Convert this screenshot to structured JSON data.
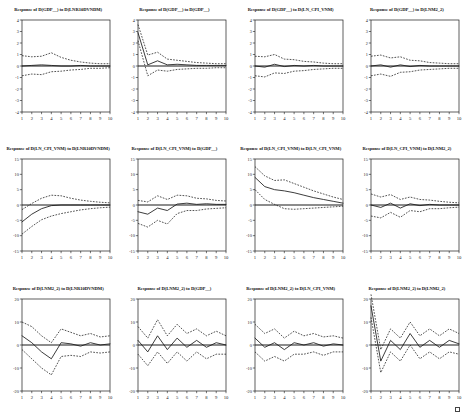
{
  "figure": {
    "name": "impulse-response-matrix",
    "rows": 3,
    "cols": 4,
    "x_ticks": [
      "1",
      "2",
      "3",
      "4",
      "5",
      "6",
      "7",
      "8",
      "9",
      "10"
    ]
  },
  "chart_data": [
    {
      "type": "line",
      "title": "Response of D(GDP__) to D(LNR10DVNDM)",
      "xlabel": "",
      "ylabel": "",
      "x": [
        1,
        2,
        3,
        4,
        5,
        6,
        7,
        8,
        9,
        10
      ],
      "xlim": [
        1,
        10
      ],
      "ylim": [
        -4,
        4
      ],
      "yticks": [
        "4",
        "3",
        "2",
        "1",
        "0",
        "-1",
        "-2",
        "-3",
        "-4"
      ],
      "grid": false,
      "legend": "none",
      "series": [
        {
          "name": "response",
          "style": "solid",
          "values": [
            0.0,
            0.05,
            0.1,
            0.05,
            0.0,
            0.0,
            0.05,
            0.0,
            0.0,
            0.0
          ]
        },
        {
          "name": "upper_2se",
          "style": "dashed",
          "values": [
            0.9,
            0.8,
            0.85,
            1.15,
            0.75,
            0.5,
            0.35,
            0.25,
            0.2,
            0.2
          ]
        },
        {
          "name": "lower_2se",
          "style": "dashed",
          "values": [
            -0.85,
            -0.7,
            -0.75,
            -0.5,
            -0.45,
            -0.35,
            -0.3,
            -0.2,
            -0.2,
            -0.15
          ]
        }
      ]
    },
    {
      "type": "line",
      "title": "Response of D(GDP__) to D(GDP__)",
      "xlabel": "",
      "ylabel": "",
      "x": [
        1,
        2,
        3,
        4,
        5,
        6,
        7,
        8,
        9,
        10
      ],
      "xlim": [
        1,
        10
      ],
      "ylim": [
        -4,
        4
      ],
      "yticks": [
        "4",
        "3",
        "2",
        "1",
        "0",
        "-1",
        "-2",
        "-3",
        "-4"
      ],
      "grid": false,
      "legend": "none",
      "series": [
        {
          "name": "response",
          "style": "solid",
          "values": [
            2.9,
            0.1,
            0.45,
            0.1,
            0.15,
            0.1,
            0.05,
            0.05,
            0.05,
            0.05
          ]
        },
        {
          "name": "upper_2se",
          "style": "dashed",
          "values": [
            3.6,
            0.95,
            1.2,
            0.6,
            0.5,
            0.4,
            0.3,
            0.25,
            0.2,
            0.2
          ]
        },
        {
          "name": "lower_2se",
          "style": "dashed",
          "values": [
            2.2,
            -0.85,
            -0.35,
            -0.45,
            -0.3,
            -0.25,
            -0.2,
            -0.2,
            -0.15,
            -0.15
          ]
        }
      ]
    },
    {
      "type": "line",
      "title": "Response of D(GDP__) to D(LN_CPI_VNM)",
      "xlabel": "",
      "ylabel": "",
      "x": [
        1,
        2,
        3,
        4,
        5,
        6,
        7,
        8,
        9,
        10
      ],
      "xlim": [
        1,
        10
      ],
      "ylim": [
        -4,
        4
      ],
      "yticks": [
        "4",
        "3",
        "2",
        "1",
        "0",
        "-1",
        "-2",
        "-3",
        "-4"
      ],
      "grid": false,
      "legend": "none",
      "series": [
        {
          "name": "response",
          "style": "solid",
          "values": [
            0.0,
            -0.1,
            0.15,
            -0.05,
            0.05,
            0.0,
            0.05,
            0.0,
            0.0,
            0.0
          ]
        },
        {
          "name": "upper_2se",
          "style": "dashed",
          "values": [
            0.85,
            0.8,
            1.0,
            0.6,
            0.55,
            0.4,
            0.35,
            0.25,
            0.2,
            0.2
          ]
        },
        {
          "name": "lower_2se",
          "style": "dashed",
          "values": [
            -0.85,
            -0.95,
            -0.6,
            -0.65,
            -0.45,
            -0.4,
            -0.3,
            -0.25,
            -0.2,
            -0.2
          ]
        }
      ]
    },
    {
      "type": "line",
      "title": "Response of D(GDP__) to D(LNM2_2)",
      "xlabel": "",
      "ylabel": "",
      "x": [
        1,
        2,
        3,
        4,
        5,
        6,
        7,
        8,
        9,
        10
      ],
      "xlim": [
        1,
        10
      ],
      "ylim": [
        -4,
        4
      ],
      "yticks": [
        "4",
        "3",
        "2",
        "1",
        "0",
        "-1",
        "-2",
        "-3",
        "-4"
      ],
      "grid": false,
      "legend": "none",
      "series": [
        {
          "name": "response",
          "style": "solid",
          "values": [
            0.0,
            0.1,
            -0.1,
            0.1,
            -0.05,
            0.05,
            0.0,
            0.0,
            0.0,
            0.0
          ]
        },
        {
          "name": "upper_2se",
          "style": "dashed",
          "values": [
            0.85,
            0.95,
            0.7,
            0.8,
            0.5,
            0.45,
            0.3,
            0.25,
            0.2,
            0.2
          ]
        },
        {
          "name": "lower_2se",
          "style": "dashed",
          "values": [
            -0.85,
            -0.7,
            -0.9,
            -0.55,
            -0.5,
            -0.35,
            -0.3,
            -0.25,
            -0.2,
            -0.2
          ]
        }
      ]
    },
    {
      "type": "line",
      "title": "Response of D(LN_CPI_VNM) to D(LNR10DVNDM)",
      "xlabel": "",
      "ylabel": "",
      "x": [
        1,
        2,
        3,
        4,
        5,
        6,
        7,
        8,
        9,
        10
      ],
      "xlim": [
        1,
        10
      ],
      "ylim": [
        -15,
        15
      ],
      "yticks": [
        "15",
        "10",
        "5",
        "0",
        "-5",
        "-10",
        "-15"
      ],
      "grid": false,
      "legend": "none",
      "series": [
        {
          "name": "response",
          "style": "solid",
          "values": [
            -5.5,
            -3.0,
            -1.2,
            -0.2,
            0.0,
            0.0,
            0.0,
            0.0,
            0.0,
            0.0
          ]
        },
        {
          "name": "upper_2se",
          "style": "dashed",
          "values": [
            -1.5,
            0.5,
            2.2,
            3.2,
            3.0,
            2.2,
            1.6,
            1.2,
            0.9,
            0.7
          ]
        },
        {
          "name": "lower_2se",
          "style": "dashed",
          "values": [
            -9.5,
            -7.0,
            -4.8,
            -3.6,
            -2.8,
            -2.2,
            -1.6,
            -1.2,
            -0.9,
            -0.7
          ]
        }
      ]
    },
    {
      "type": "line",
      "title": "Response of D(LN_CPI_VNM) to D(GDP__)",
      "xlabel": "",
      "ylabel": "",
      "x": [
        1,
        2,
        3,
        4,
        5,
        6,
        7,
        8,
        9,
        10
      ],
      "xlim": [
        1,
        10
      ],
      "ylim": [
        -15,
        15
      ],
      "yticks": [
        "15",
        "10",
        "5",
        "0",
        "-5",
        "-10",
        "-15"
      ],
      "grid": false,
      "legend": "none",
      "series": [
        {
          "name": "response",
          "style": "solid",
          "values": [
            -2.2,
            -3.0,
            -1.0,
            -1.8,
            0.3,
            0.6,
            0.2,
            0.4,
            0.2,
            0.2
          ]
        },
        {
          "name": "upper_2se",
          "style": "dashed",
          "values": [
            1.5,
            1.0,
            3.0,
            1.8,
            3.2,
            3.0,
            2.2,
            2.0,
            1.5,
            1.3
          ]
        },
        {
          "name": "lower_2se",
          "style": "dashed",
          "values": [
            -6.0,
            -7.2,
            -5.0,
            -6.2,
            -2.8,
            -1.8,
            -1.8,
            -1.3,
            -1.1,
            -0.9
          ]
        }
      ]
    },
    {
      "type": "line",
      "title": "Response of D(LN_CPI_VNM) to D(LN_CPI_VNM)",
      "xlabel": "",
      "ylabel": "",
      "x": [
        1,
        2,
        3,
        4,
        5,
        6,
        7,
        8,
        9,
        10
      ],
      "xlim": [
        1,
        10
      ],
      "ylim": [
        -15,
        15
      ],
      "yticks": [
        "15",
        "10",
        "5",
        "0",
        "-5",
        "-10",
        "-15"
      ],
      "grid": false,
      "legend": "none",
      "series": [
        {
          "name": "response",
          "style": "solid",
          "values": [
            9.0,
            6.0,
            5.0,
            4.6,
            4.0,
            3.2,
            2.4,
            1.8,
            1.2,
            0.6
          ]
        },
        {
          "name": "upper_2se",
          "style": "dashed",
          "values": [
            12.5,
            9.5,
            8.0,
            8.2,
            7.0,
            5.8,
            4.6,
            3.6,
            2.6,
            1.8
          ]
        },
        {
          "name": "lower_2se",
          "style": "dashed",
          "values": [
            5.0,
            1.8,
            0.2,
            -1.2,
            -1.4,
            -1.2,
            -1.0,
            -0.8,
            -0.6,
            -0.4
          ]
        }
      ]
    },
    {
      "type": "line",
      "title": "Response of D(LN_CPI_VNM) to D(LNM2_2)",
      "xlabel": "",
      "ylabel": "",
      "x": [
        1,
        2,
        3,
        4,
        5,
        6,
        7,
        8,
        9,
        10
      ],
      "xlim": [
        1,
        10
      ],
      "ylim": [
        -15,
        15
      ],
      "yticks": [
        "15",
        "10",
        "5",
        "0",
        "-5",
        "-10",
        "-15"
      ],
      "grid": false,
      "legend": "none",
      "series": [
        {
          "name": "response",
          "style": "solid",
          "values": [
            0.0,
            -0.8,
            0.6,
            -1.0,
            0.4,
            -0.2,
            0.2,
            0.0,
            0.0,
            0.0
          ]
        },
        {
          "name": "upper_2se",
          "style": "dashed",
          "values": [
            3.6,
            2.6,
            3.4,
            1.8,
            2.6,
            1.8,
            1.6,
            1.2,
            0.9,
            0.7
          ]
        },
        {
          "name": "lower_2se",
          "style": "dashed",
          "values": [
            -3.6,
            -4.2,
            -2.4,
            -4.0,
            -1.8,
            -2.2,
            -1.2,
            -1.2,
            -0.9,
            -0.7
          ]
        }
      ]
    },
    {
      "type": "line",
      "title": "Response of D(LNM2_2) to D(LNR10DVNDM)",
      "xlabel": "",
      "ylabel": "",
      "x": [
        1,
        2,
        3,
        4,
        5,
        6,
        7,
        8,
        9,
        10
      ],
      "xlim": [
        1,
        10
      ],
      "ylim": [
        -20,
        20
      ],
      "yticks": [
        "20",
        "10",
        "0",
        "-10",
        "-20"
      ],
      "grid": false,
      "legend": "none",
      "series": [
        {
          "name": "response",
          "style": "solid",
          "values": [
            4.0,
            1.0,
            -3.0,
            -6.0,
            1.0,
            0.5,
            -0.5,
            1.0,
            0.0,
            0.5
          ]
        },
        {
          "name": "upper_2se",
          "style": "dashed",
          "values": [
            10.0,
            8.0,
            4.0,
            1.0,
            7.0,
            5.5,
            4.0,
            5.0,
            3.5,
            4.0
          ]
        },
        {
          "name": "lower_2se",
          "style": "dashed",
          "values": [
            -2.0,
            -6.0,
            -10.0,
            -13.0,
            -5.0,
            -4.5,
            -5.0,
            -3.0,
            -3.5,
            -3.0
          ]
        }
      ]
    },
    {
      "type": "line",
      "title": "Response of D(LNM2_2) to D(GDP__)",
      "xlabel": "",
      "ylabel": "",
      "x": [
        1,
        2,
        3,
        4,
        5,
        6,
        7,
        8,
        9,
        10
      ],
      "xlim": [
        1,
        10
      ],
      "ylim": [
        -20,
        20
      ],
      "yticks": [
        "20",
        "10",
        "0",
        "-10",
        "-20"
      ],
      "grid": false,
      "legend": "none",
      "series": [
        {
          "name": "response",
          "style": "solid",
          "values": [
            2.0,
            -3.0,
            4.0,
            -2.0,
            3.0,
            -1.0,
            2.0,
            -1.0,
            1.0,
            0.0
          ]
        },
        {
          "name": "upper_2se",
          "style": "dashed",
          "values": [
            8.0,
            3.0,
            11.0,
            4.0,
            9.0,
            5.0,
            7.0,
            4.0,
            6.0,
            4.0
          ]
        },
        {
          "name": "lower_2se",
          "style": "dashed",
          "values": [
            -4.0,
            -9.0,
            -3.0,
            -8.0,
            -3.0,
            -7.0,
            -3.0,
            -6.0,
            -4.0,
            -4.0
          ]
        }
      ]
    },
    {
      "type": "line",
      "title": "Response of D(LNM2_2) to D(LN_CPI_VNM)",
      "xlabel": "",
      "ylabel": "",
      "x": [
        1,
        2,
        3,
        4,
        5,
        6,
        7,
        8,
        9,
        10
      ],
      "xlim": [
        1,
        10
      ],
      "ylim": [
        -20,
        20
      ],
      "yticks": [
        "20",
        "10",
        "0",
        "-10",
        "-20"
      ],
      "grid": false,
      "legend": "none",
      "series": [
        {
          "name": "response",
          "style": "solid",
          "values": [
            3.0,
            -1.0,
            1.0,
            -2.0,
            1.0,
            0.0,
            1.0,
            -0.5,
            0.5,
            0.0
          ]
        },
        {
          "name": "upper_2se",
          "style": "dashed",
          "values": [
            9.0,
            5.0,
            7.0,
            3.0,
            6.0,
            4.0,
            5.0,
            3.5,
            4.0,
            3.0
          ]
        },
        {
          "name": "lower_2se",
          "style": "dashed",
          "values": [
            -3.0,
            -7.0,
            -5.0,
            -7.0,
            -4.0,
            -4.0,
            -3.0,
            -4.5,
            -3.0,
            -3.0
          ]
        }
      ]
    },
    {
      "type": "line",
      "title": "Response of D(LNM2_2) to D(LNM2_2)",
      "xlabel": "",
      "ylabel": "",
      "x": [
        1,
        2,
        3,
        4,
        5,
        6,
        7,
        8,
        9,
        10
      ],
      "xlim": [
        1,
        10
      ],
      "ylim": [
        -20,
        20
      ],
      "yticks": [
        "20",
        "10",
        "0",
        "-10",
        "-20"
      ],
      "grid": false,
      "legend": "none",
      "series": [
        {
          "name": "response",
          "style": "solid",
          "values": [
            17.0,
            -7.0,
            2.0,
            -2.0,
            5.0,
            -1.0,
            2.0,
            -1.0,
            2.0,
            0.5
          ]
        },
        {
          "name": "upper_2se",
          "style": "dashed",
          "values": [
            22.0,
            -2.0,
            7.0,
            3.0,
            10.0,
            4.0,
            7.0,
            4.0,
            7.0,
            5.0
          ]
        },
        {
          "name": "lower_2se",
          "style": "dashed",
          "values": [
            12.0,
            -12.0,
            -3.0,
            -7.0,
            0.0,
            -6.0,
            -3.0,
            -6.0,
            -3.0,
            -4.0
          ]
        }
      ]
    }
  ]
}
